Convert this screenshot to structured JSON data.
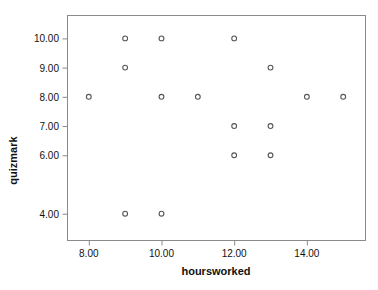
{
  "chart_data": {
    "type": "scatter",
    "title": "",
    "xlabel": "hoursworked",
    "ylabel": "quizmark",
    "xlim": [
      7.4,
      15.6
    ],
    "ylim": [
      3.1,
      10.8
    ],
    "grid": false,
    "legend": null,
    "marker": "open-circle",
    "marker_color": "#555555",
    "xticks": [
      8,
      10,
      12,
      14
    ],
    "xticklabels": [
      "8.00",
      "10.00",
      "12.00",
      "14.00"
    ],
    "yticks": [
      10,
      9,
      8,
      7,
      6,
      4
    ],
    "yticklabels": [
      "10.00",
      "9.00",
      "8.00",
      "7.00",
      "6.00",
      "4.00"
    ],
    "x": [
      8,
      9,
      9,
      9,
      10,
      10,
      10,
      11,
      12,
      12,
      12,
      13,
      13,
      13,
      14,
      15
    ],
    "y": [
      8,
      10,
      9,
      4,
      10,
      8,
      4,
      8,
      10,
      7,
      6,
      9,
      7,
      6,
      8,
      8
    ],
    "points": [
      {
        "x": 8,
        "y": 8
      },
      {
        "x": 9,
        "y": 10
      },
      {
        "x": 9,
        "y": 9
      },
      {
        "x": 9,
        "y": 4
      },
      {
        "x": 10,
        "y": 10
      },
      {
        "x": 10,
        "y": 8
      },
      {
        "x": 10,
        "y": 4
      },
      {
        "x": 11,
        "y": 8
      },
      {
        "x": 12,
        "y": 10
      },
      {
        "x": 12,
        "y": 7
      },
      {
        "x": 12,
        "y": 6
      },
      {
        "x": 13,
        "y": 9
      },
      {
        "x": 13,
        "y": 7
      },
      {
        "x": 13,
        "y": 6
      },
      {
        "x": 14,
        "y": 8
      },
      {
        "x": 15,
        "y": 8
      }
    ]
  },
  "axes": {
    "x_title": "hoursworked",
    "y_title": "quizmark",
    "frame_color": "#8a8a8a",
    "text_color": "#111111"
  }
}
